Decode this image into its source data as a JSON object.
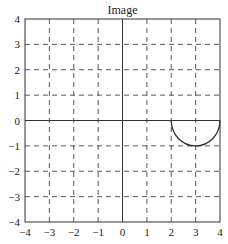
{
  "chart_data": {
    "type": "line",
    "title": "Image",
    "xlabel": "",
    "ylabel": "",
    "xlim": [
      -4,
      4
    ],
    "ylim": [
      -4,
      4
    ],
    "grid": true,
    "grid_style": "dashed",
    "xticks": [
      -4,
      -3,
      -2,
      -1,
      0,
      1,
      2,
      3,
      4
    ],
    "yticks": [
      -4,
      -3,
      -2,
      -1,
      0,
      1,
      2,
      3,
      4
    ],
    "xtick_labels": [
      "−4",
      "−3",
      "−2",
      "−1",
      "0",
      "1",
      "2",
      "3",
      "4"
    ],
    "ytick_labels": [
      "−4",
      "−3",
      "−2",
      "−1",
      "0",
      "1",
      "2",
      "3",
      "4"
    ],
    "axes_lines": {
      "x_axis_at_y": 0,
      "y_axis_at_x": 0
    },
    "series": [
      {
        "name": "lower half-ellipse",
        "shape": "half-ellipse",
        "center": [
          3,
          0
        ],
        "radius_x": 1,
        "radius_y": 1,
        "x_range": [
          2,
          4
        ],
        "half": "lower",
        "points": [
          [
            2,
            0
          ],
          [
            2.25,
            -0.66
          ],
          [
            2.5,
            -0.87
          ],
          [
            2.75,
            -0.97
          ],
          [
            3,
            -1
          ],
          [
            3.25,
            -0.97
          ],
          [
            3.5,
            -0.87
          ],
          [
            3.75,
            -0.66
          ],
          [
            4,
            0
          ]
        ],
        "color": "#333333"
      }
    ],
    "legend": null
  },
  "colors": {
    "line": "#333333",
    "frame": "#333333",
    "grid": "#444444",
    "background": "#ffffff"
  }
}
